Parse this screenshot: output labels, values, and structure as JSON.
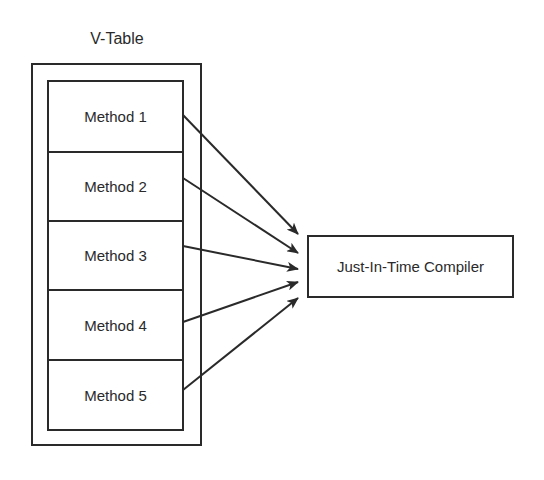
{
  "diagram": {
    "title": "V-Table",
    "methods": [
      {
        "label": "Method 1"
      },
      {
        "label": "Method 2"
      },
      {
        "label": "Method 3"
      },
      {
        "label": "Method 4"
      },
      {
        "label": "Method 5"
      }
    ],
    "target": "Just-In-Time Compiler",
    "edges": [
      {
        "from": "Method 1",
        "to": "Just-In-Time Compiler"
      },
      {
        "from": "Method 2",
        "to": "Just-In-Time Compiler"
      },
      {
        "from": "Method 3",
        "to": "Just-In-Time Compiler"
      },
      {
        "from": "Method 4",
        "to": "Just-In-Time Compiler"
      },
      {
        "from": "Method 5",
        "to": "Just-In-Time Compiler"
      }
    ]
  }
}
